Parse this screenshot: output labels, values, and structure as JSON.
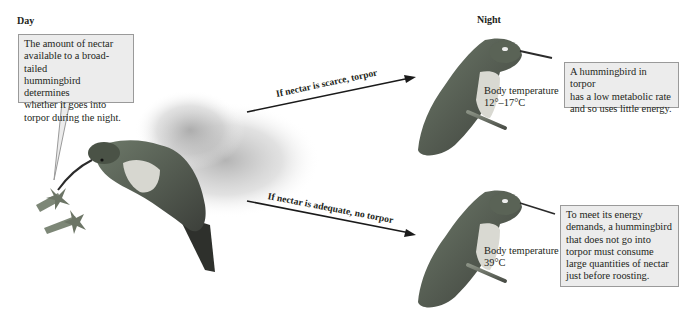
{
  "headings": {
    "day": "Day",
    "night": "Night"
  },
  "callouts": {
    "day_box": {
      "lines": [
        "The amount of nectar",
        "available to a broad-tailed",
        "hummingbird determines",
        "whether it goes into",
        "torpor during the night."
      ]
    },
    "torpor_box": {
      "lines": [
        "A hummingbird in torpor",
        "has a low metabolic rate",
        "and so uses little energy."
      ]
    },
    "no_torpor_box": {
      "lines": [
        "To meet its energy",
        "demands, a hummingbird",
        "that does not go into",
        "torpor must consume",
        "large quantities of nectar",
        "just before roosting."
      ]
    }
  },
  "arrows": {
    "scarce": "If nectar is scarce, torpor",
    "adequate": "If nectar is adequate, no torpor"
  },
  "temperatures": {
    "torpor": {
      "label": "Body temperature",
      "value": "12°–17°C"
    },
    "no_torpor": {
      "label": "Body temperature",
      "value": "39°C"
    }
  },
  "colors": {
    "box_fill": "#ececec",
    "box_border": "#9a9a9a",
    "text": "#231f20",
    "arrow": "#1a1a1a"
  }
}
